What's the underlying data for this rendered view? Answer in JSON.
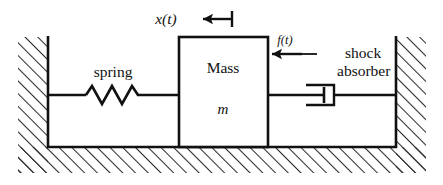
{
  "figure": {
    "type": "mechanical-schematic",
    "background_color": "#ffffff",
    "line_color": "#111111",
    "hatch_color": "#333333"
  },
  "labels": {
    "displacement": "x(t)",
    "force": "f(t)",
    "spring": "spring",
    "mass_name": "Mass",
    "mass_symbol": "m",
    "damper_line1": "shock",
    "damper_line2": "absorber"
  },
  "components": [
    {
      "name": "left-wall",
      "kind": "fixed-support",
      "hatching": "diagonal",
      "x": 18,
      "y": 37,
      "width": 30,
      "height": 136
    },
    {
      "name": "right-wall",
      "kind": "fixed-support",
      "hatching": "diagonal",
      "x": 396,
      "y": 37,
      "width": 30,
      "height": 136
    },
    {
      "name": "ground",
      "kind": "fixed-support",
      "hatching": "diagonal",
      "x": 18,
      "y": 147,
      "width": 408,
      "height": 26
    },
    {
      "name": "spring",
      "kind": "coil-spring",
      "zigzag_peaks": 3,
      "x_start": 85,
      "x_end": 143,
      "y": 95
    },
    {
      "name": "mass-block",
      "kind": "rigid-body",
      "x": 179,
      "y": 37,
      "width": 89,
      "height": 110
    },
    {
      "name": "damper",
      "kind": "dashpot",
      "x": 305,
      "y": 95,
      "cylinder_width": 38,
      "cylinder_height": 20
    }
  ],
  "annotations": [
    {
      "name": "displacement-arrow",
      "label": "x(t)",
      "direction": "left",
      "x_tail": 232,
      "x_head": 199,
      "y": 19
    },
    {
      "name": "force-arrow",
      "label": "f(t)",
      "direction": "left",
      "x_tail": 302,
      "x_head": 268,
      "y": 54
    },
    {
      "name": "damper-leader-line",
      "x_start": 302,
      "x_end": 316,
      "y": 54
    }
  ]
}
